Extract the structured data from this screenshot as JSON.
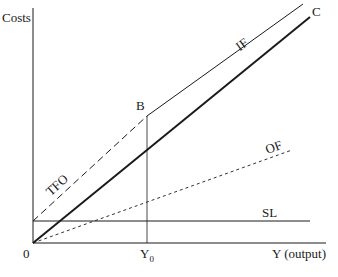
{
  "diagram": {
    "y_axis_label": "Costs",
    "x_axis_label": "Y (output)",
    "origin_label": "0",
    "point_label": "B",
    "y0_label_main": "Y",
    "y0_label_sub": "0",
    "curves": {
      "C": "C",
      "IF": "IF",
      "OF": "OF",
      "TFO": "TFO",
      "SL": "SL"
    },
    "colors": {
      "ink": "#1a1a1a",
      "background": "#ffffff"
    }
  }
}
